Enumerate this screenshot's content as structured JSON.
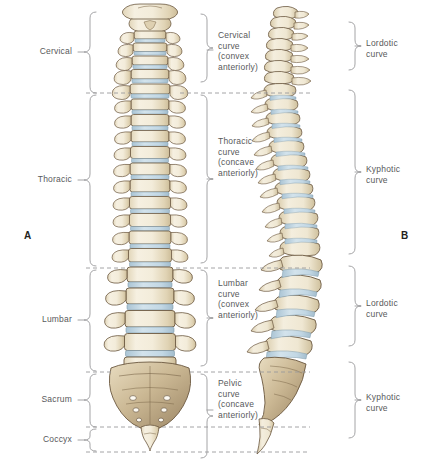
{
  "figure": {
    "panels": [
      {
        "id": "A",
        "name": "anterior-view",
        "x": 28,
        "y": 236
      },
      {
        "id": "B",
        "name": "lateral-view",
        "x": 404,
        "y": 236
      }
    ],
    "colors": {
      "bone_fill": "#f3ecda",
      "bone_shade": "#ddd0b2",
      "bone_outline": "#6b5840",
      "disc_fill": "#c8dae6",
      "disc_outline": "#7e9aab",
      "text": "#58595b",
      "bracket": "#9a9a9c",
      "dash": "#9a9a9c",
      "background": "#ffffff"
    }
  },
  "regions": {
    "heading": "Vertebral regions",
    "items": [
      {
        "label": "Cervical",
        "y_top": 12,
        "y_bottom": 93,
        "label_y": 52,
        "count": 7
      },
      {
        "label": "Thoracic",
        "y_top": 93,
        "y_bottom": 268,
        "label_y": 180,
        "count": 12
      },
      {
        "label": "Lumbar",
        "y_top": 268,
        "y_bottom": 372,
        "label_y": 320,
        "count": 5
      },
      {
        "label": "Sacrum",
        "y_top": 372,
        "y_bottom": 427,
        "label_y": 400,
        "count": 5
      },
      {
        "label": "Coccyx",
        "y_top": 427,
        "y_bottom": 452,
        "label_y": 440,
        "count": 4
      }
    ]
  },
  "curves_middle": {
    "heading": "Curvature descriptions",
    "items": [
      {
        "name": "Cervical curve",
        "line1": "Cervical",
        "line2": "curve",
        "line3": "(convex",
        "line4": "anteriorly)",
        "y_top": 14,
        "y_bottom": 90,
        "label_y": 34
      },
      {
        "name": "Thoracic curve",
        "line1": "Thoracic",
        "line2": "curve",
        "line3": "(concave",
        "line4": "anteriorly)",
        "y_top": 94,
        "y_bottom": 268,
        "label_y": 138
      },
      {
        "name": "Lumbar curve",
        "line1": "Lumbar",
        "line2": "curve",
        "line3": "(convex",
        "line4": "anteriorly)",
        "y_top": 270,
        "y_bottom": 364,
        "label_y": 282
      },
      {
        "name": "Pelvic curve",
        "line1": "Pelvic",
        "line2": "curve",
        "line3": "(concave",
        "line4": "anteriorly)",
        "y_top": 368,
        "y_bottom": 452,
        "label_y": 378
      }
    ]
  },
  "curves_right": {
    "heading": "Curvature types",
    "items": [
      {
        "name": "Cervical lordotic",
        "line1": "Lordotic",
        "line2": "curve",
        "y_top": 22,
        "y_bottom": 85,
        "label_y": 43
      },
      {
        "name": "Thoracic kyphotic",
        "line1": "Kyphotic",
        "line2": "curve",
        "y_top": 90,
        "y_bottom": 262,
        "label_y": 160
      },
      {
        "name": "Lumbar lordotic",
        "line1": "Lordotic",
        "line2": "curve",
        "y_top": 266,
        "y_bottom": 358,
        "label_y": 300
      },
      {
        "name": "Sacral kyphotic",
        "line1": "Kyphotic",
        "line2": "curve",
        "y_top": 362,
        "y_bottom": 448,
        "label_y": 393
      }
    ]
  },
  "separators": {
    "name": "dashed-divider-lines",
    "rows": [
      {
        "y": 93,
        "x1": 86,
        "x2": 310
      },
      {
        "y": 268,
        "x1": 86,
        "x2": 310
      },
      {
        "y": 372,
        "x1": 86,
        "x2": 310
      },
      {
        "y": 427,
        "x1": 86,
        "x2": 310
      },
      {
        "y": 452,
        "x1": 86,
        "x2": 310
      }
    ]
  }
}
